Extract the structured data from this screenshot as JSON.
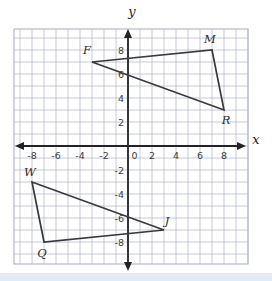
{
  "figure": {
    "axes": {
      "x_label": "x",
      "y_label": "y"
    },
    "colors": {
      "background": "#ffffff",
      "grid": "#b7bdc9",
      "grid_border": "#a6acb8",
      "axis": "#232327",
      "shape": "#3a3a3e",
      "tick_text": "#3d3d42",
      "vertex_text": "#2c2c30",
      "bottom_strip": "#e4eaf5"
    }
  },
  "chart_data": {
    "type": "coordinate-plane-geometry",
    "grid": "on",
    "cell_units": 1,
    "x_axis_label": "x",
    "y_axis_label": "y",
    "x_tick_labels": [
      "-8",
      "-6",
      "-4",
      "-2",
      "0",
      "2",
      "4",
      "6",
      "8"
    ],
    "y_tick_labels": [
      "8",
      "6",
      "4",
      "2",
      "-2",
      "-4",
      "-6",
      "-8"
    ],
    "triangles": [
      {
        "name": "FMR",
        "vertices": [
          {
            "label": "F",
            "x": -3,
            "y": 7,
            "ldx": -5,
            "ldy": -8
          },
          {
            "label": "M",
            "x": 7,
            "y": 8,
            "ldx": -2,
            "ldy": -7
          },
          {
            "label": "R",
            "x": 8,
            "y": 3,
            "ldx": 2,
            "ldy": 14
          }
        ]
      },
      {
        "name": "WQJ",
        "vertices": [
          {
            "label": "W",
            "x": -8,
            "y": -3,
            "ldx": -2,
            "ldy": -6
          },
          {
            "label": "Q",
            "x": -7,
            "y": -8,
            "ldx": -2,
            "ldy": 15
          },
          {
            "label": "J",
            "x": 3,
            "y": -7,
            "ldx": 3,
            "ldy": -5
          }
        ]
      }
    ]
  }
}
